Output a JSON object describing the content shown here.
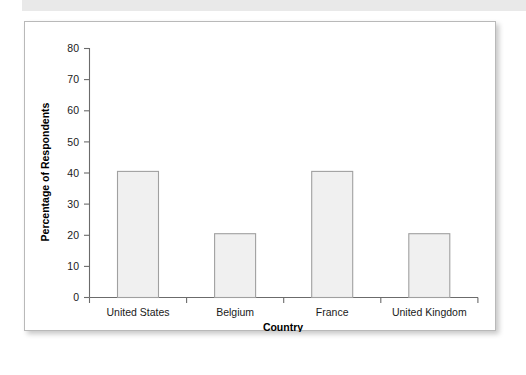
{
  "chart_data": {
    "type": "bar",
    "title": "",
    "subtitle": "",
    "categories": [
      "United States",
      "Belgium",
      "France",
      "United Kingdom"
    ],
    "values": [
      68,
      45.5,
      40.5,
      20.5
    ],
    "xlabel": "Country",
    "ylabel": "Percentage of Respondents",
    "ylim": [
      0,
      80
    ],
    "yticks": [
      0,
      10,
      20,
      30,
      40,
      50,
      60,
      70,
      80
    ],
    "ytick_labels": [
      "0",
      "10",
      "20",
      "30",
      "40",
      "50",
      "60",
      "70",
      "80"
    ],
    "grid": false,
    "legend": null,
    "legend_position": "none",
    "annotations": [],
    "series": [
      {
        "name": "Percentage of Respondents",
        "values": [
          68,
          45.5,
          40.5,
          20.5
        ]
      }
    ],
    "colors": {
      "bar_fill": "#f0f0f0",
      "bar_stroke": "#a0a0a0",
      "axis": "#6b6b6b",
      "text": "#1a1a1a",
      "frame": "#b9b9b9",
      "background": "#ffffff"
    }
  }
}
